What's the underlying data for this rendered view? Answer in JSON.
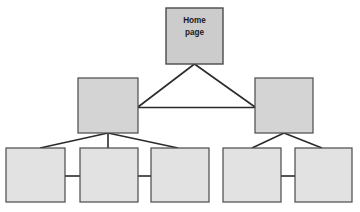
{
  "diagram": {
    "type": "site-map-hierarchy",
    "title": "",
    "background_color": "#ffffff",
    "box_fill_level1": "#cccccc",
    "box_fill_level2": "#d4d4d4",
    "box_fill_level3": "#e2e2e2",
    "box_border_color": "#4a4a4a",
    "connector_color": "#2b2b2b",
    "levels": [
      {
        "level": 1,
        "nodes": [
          {
            "id": "home",
            "label_line1": "Home",
            "label_line2": "page",
            "x": 166,
            "y": 8,
            "width": 57,
            "height": 56,
            "fill": "#cccccc"
          }
        ]
      },
      {
        "level": 2,
        "nodes": [
          {
            "id": "section-left",
            "label_line1": "",
            "label_line2": "",
            "x": 78,
            "y": 78,
            "width": 60,
            "height": 55,
            "fill": "#d4d4d4"
          },
          {
            "id": "section-right",
            "label_line1": "",
            "label_line2": "",
            "x": 255,
            "y": 78,
            "width": 58,
            "height": 55,
            "fill": "#d4d4d4"
          }
        ]
      },
      {
        "level": 3,
        "nodes": [
          {
            "id": "page-1",
            "label_line1": "",
            "label_line2": "",
            "x": 6,
            "y": 148,
            "width": 59,
            "height": 54,
            "fill": "#e2e2e2"
          },
          {
            "id": "page-2",
            "label_line1": "",
            "label_line2": "",
            "x": 80,
            "y": 148,
            "width": 58,
            "height": 54,
            "fill": "#e2e2e2"
          },
          {
            "id": "page-3",
            "label_line1": "",
            "label_line2": "",
            "x": 151,
            "y": 148,
            "width": 58,
            "height": 54,
            "fill": "#e2e2e2"
          },
          {
            "id": "page-4",
            "label_line1": "",
            "label_line2": "",
            "x": 223,
            "y": 148,
            "width": 58,
            "height": 54,
            "fill": "#e2e2e2"
          },
          {
            "id": "page-5",
            "label_line1": "",
            "label_line2": "",
            "x": 295,
            "y": 148,
            "width": 57,
            "height": 54,
            "fill": "#e2e2e2"
          }
        ]
      }
    ],
    "connectors": [
      {
        "id": "home-to-section-left",
        "from": "home",
        "to": "section-left",
        "x1": 194.5,
        "y1": 64,
        "x2": 138,
        "y2": 107
      },
      {
        "id": "home-to-section-right",
        "from": "home",
        "to": "section-right",
        "x1": 194.5,
        "y1": 64,
        "x2": 255,
        "y2": 107
      },
      {
        "id": "section-left-to-section-right",
        "from": "section-left",
        "to": "section-right",
        "x1": 138,
        "y1": 107.5,
        "x2": 255,
        "y2": 107.5
      },
      {
        "id": "section-left-to-page-1",
        "from": "section-left",
        "to": "page-1",
        "x1": 108,
        "y1": 133,
        "x2": 40,
        "y2": 148
      },
      {
        "id": "section-left-to-page-2",
        "from": "section-left",
        "to": "page-2",
        "x1": 108,
        "y1": 133,
        "x2": 108,
        "y2": 148
      },
      {
        "id": "section-left-to-page-3",
        "from": "section-left",
        "to": "page-3",
        "x1": 108,
        "y1": 133,
        "x2": 178,
        "y2": 148
      },
      {
        "id": "section-right-to-page-4",
        "from": "section-right",
        "to": "page-4",
        "x1": 284,
        "y1": 133,
        "x2": 252,
        "y2": 148
      },
      {
        "id": "section-right-to-page-5",
        "from": "section-right",
        "to": "page-5",
        "x1": 284,
        "y1": 133,
        "x2": 322,
        "y2": 148
      },
      {
        "id": "page-1-to-page-2",
        "from": "page-1",
        "to": "page-2",
        "x1": 65,
        "y1": 176,
        "x2": 80,
        "y2": 176
      },
      {
        "id": "page-2-to-page-3",
        "from": "page-2",
        "to": "page-3",
        "x1": 138,
        "y1": 176,
        "x2": 151,
        "y2": 176
      },
      {
        "id": "page-4-to-page-5",
        "from": "page-4",
        "to": "page-5",
        "x1": 281,
        "y1": 176,
        "x2": 295,
        "y2": 176
      }
    ]
  }
}
